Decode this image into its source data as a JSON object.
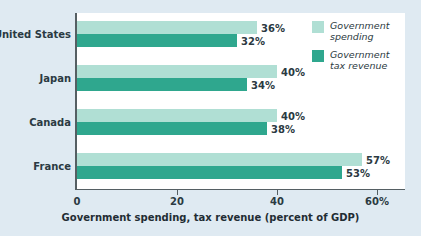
{
  "chart_data": {
    "type": "bar",
    "orientation": "horizontal",
    "title": "",
    "xlabel": "Government spending, tax revenue (percent of GDP)",
    "ylabel": "",
    "categories": [
      "United States",
      "Japan",
      "Canada",
      "France"
    ],
    "series": [
      {
        "name": "Government spending",
        "color": "#b0dfd4",
        "values": [
          36,
          40,
          40,
          57
        ],
        "labels": [
          "36%",
          "40%",
          "40%",
          "57%"
        ]
      },
      {
        "name": "Government tax revenue",
        "color": "#2fa78e",
        "values": [
          32,
          34,
          38,
          53
        ],
        "labels": [
          "32%",
          "34%",
          "38%",
          "53%"
        ]
      }
    ],
    "xlim": [
      0,
      66
    ],
    "xticks": [
      0,
      20,
      40,
      60
    ],
    "xtick_labels": [
      "0",
      "20",
      "40",
      "60%"
    ],
    "grid": false,
    "legend_position": "top-right"
  },
  "legend": {
    "items": [
      {
        "label": "Government spending",
        "color": "#b0dfd4"
      },
      {
        "label": "Government tax revenue",
        "color": "#2fa78e"
      }
    ]
  },
  "colors": {
    "background": "#dfeaf2",
    "panel": "#ffffff",
    "axis": "#555f63",
    "text": "#2b3a42",
    "spending": "#b0dfd4",
    "revenue": "#2fa78e"
  }
}
